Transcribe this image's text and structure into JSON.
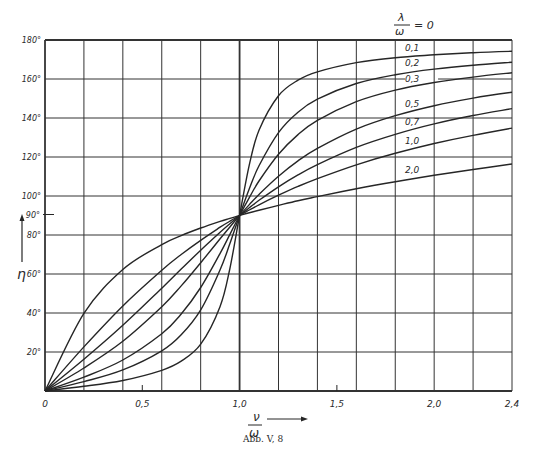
{
  "chart_data": {
    "type": "line",
    "title": "",
    "caption": "Abb. V, 8",
    "xlabel": "ν/ω",
    "ylabel": "η",
    "xlim": [
      0,
      2.4
    ],
    "ylim": [
      0,
      180
    ],
    "grid": true,
    "x_gridlines": [
      0,
      0.2,
      0.4,
      0.6,
      0.8,
      1.0,
      1.2,
      1.4,
      1.6,
      1.8,
      2.0,
      2.2,
      2.4
    ],
    "y_gridlines": [
      0,
      20,
      40,
      60,
      80,
      100,
      120,
      140,
      160,
      180
    ],
    "x_tick_labels": [
      {
        "value": 0,
        "label": "0"
      },
      {
        "value": 0.5,
        "label": "0,5"
      },
      {
        "value": 1.0,
        "label": "1,0"
      },
      {
        "value": 1.5,
        "label": "1,5"
      },
      {
        "value": 2.0,
        "label": "2,0"
      },
      {
        "value": 2.4,
        "label": "2,4"
      }
    ],
    "y_tick_labels": [
      {
        "value": 20,
        "label": "20°"
      },
      {
        "value": 40,
        "label": "40°"
      },
      {
        "value": 60,
        "label": "60°"
      },
      {
        "value": 80,
        "label": "80°"
      },
      {
        "value": 90,
        "label": "90°"
      },
      {
        "value": 100,
        "label": "100°"
      },
      {
        "value": 120,
        "label": "120°"
      },
      {
        "value": 140,
        "label": "140°"
      },
      {
        "value": 160,
        "label": "160°"
      },
      {
        "value": 180,
        "label": "180°"
      }
    ],
    "legend": {
      "title": "λ/ω = 0",
      "position": "top-right, inline labels on curves"
    },
    "x": [
      0,
      0.2,
      0.4,
      0.6,
      0.7,
      0.8,
      0.9,
      0.95,
      1.0,
      1.05,
      1.1,
      1.2,
      1.3,
      1.4,
      1.6,
      1.8,
      2.0,
      2.2,
      2.4
    ],
    "series": [
      {
        "name": "0,1",
        "label_pos": [
          1.85,
          174.5
        ],
        "values": [
          0,
          2.4,
          5.4,
          10.6,
          15.3,
          24.0,
          43.4,
          62.8,
          90,
          116.0,
          133.7,
          151.4,
          159.4,
          163.7,
          168.4,
          170.9,
          172.4,
          173.5,
          174.2
        ]
      },
      {
        "name": "0,2",
        "label_pos": [
          1.85,
          166.5
        ],
        "values": [
          0,
          4.8,
          10.8,
          20.6,
          28.8,
          41.6,
          62.2,
          75.6,
          90,
          103.7,
          115.5,
          132.5,
          143.0,
          149.7,
          157.7,
          162.2,
          165.1,
          167.1,
          168.6
        ]
      },
      {
        "name": "0,3",
        "label_pos": [
          1.85,
          158.5
        ],
        "values": [
          0,
          7.1,
          15.9,
          29.4,
          39.5,
          53.1,
          70.6,
          80.3,
          90,
          99.2,
          107.7,
          121.4,
          131.5,
          138.8,
          148.4,
          154.3,
          158.2,
          161.0,
          163.2
        ]
      },
      {
        "name": "0,5",
        "label_pos": [
          1.85,
          145.5
        ],
        "values": [
          0,
          11.8,
          25.5,
          43.2,
          53.9,
          65.8,
          78.1,
          84.1,
          90,
          95.6,
          100.8,
          110.1,
          118.0,
          124.4,
          134.3,
          141.2,
          146.3,
          150.2,
          153.2
        ]
      },
      {
        "name": "0,7",
        "label_pos": [
          1.85,
          136.5
        ],
        "values": [
          0,
          16.3,
          33.7,
          52.7,
          62.5,
          72.2,
          81.4,
          85.8,
          90,
          94.0,
          97.8,
          104.7,
          110.8,
          116.1,
          124.9,
          131.6,
          137.0,
          141.3,
          144.8
        ]
      },
      {
        "name": "1,0",
        "label_pos": [
          1.85,
          126.5
        ],
        "values": [
          0,
          22.6,
          43.6,
          61.9,
          70.0,
          77.3,
          84.0,
          87.1,
          90,
          92.8,
          95.5,
          100.4,
          104.9,
          108.9,
          116.0,
          121.9,
          126.9,
          131.1,
          134.8
        ]
      },
      {
        "name": "2,0",
        "label_pos": [
          1.85,
          112.0
        ],
        "values": [
          0,
          39.8,
          62.3,
          75.1,
          79.7,
          83.6,
          87.0,
          88.5,
          90,
          91.4,
          92.7,
          95.2,
          97.6,
          99.7,
          103.7,
          107.3,
          110.6,
          113.6,
          116.4
        ]
      }
    ]
  },
  "figure": {
    "caption": "Abb. V, 8",
    "y_axis_symbol": "η",
    "x_axis_numerator": "ν",
    "x_axis_denominator": "ω",
    "legend_numerator": "λ",
    "legend_denominator": "ω",
    "legend_suffix": "= 0"
  },
  "style": {
    "ink": "#262626",
    "grid": "#333333",
    "background": "#ffffff"
  }
}
